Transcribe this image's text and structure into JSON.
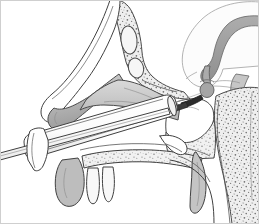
{
  "figure": {
    "kind": "anatomical-line-illustration",
    "view": "midsagittal section of the head",
    "width": 259,
    "height": 224,
    "background_color": "#ffffff",
    "has_labels": false,
    "has_text": false,
    "has_border": true,
    "border_color": "#cfcfcf",
    "line_color": "#404040"
  },
  "palette": {
    "paper": "#ffffff",
    "outline": "#404040",
    "thin_line": "#595959",
    "hairline": "#8a8a8a",
    "soft_tissue": "#bfbfbf",
    "soft_tissue_dark": "#9a9a9a",
    "mucosa": "#d4d4d4",
    "cartilage": "#c9c9c9",
    "bone_fill": "#ececec",
    "bone_stipple": "#6e6e6e",
    "brain_fill": "#fbfbfb",
    "brain_outline": "#b0b0b0",
    "corpus_callosum": "#9a9a9a",
    "pituitary": "#a8a8a8",
    "instrument_fill": "#fdfdfd",
    "instrument_shadow": "#e6e6e6",
    "instrument_tip": "#2d2d2d",
    "tooth_fill": "#f7f7f7"
  },
  "anatomy": {
    "structures": [
      {
        "name": "frontal-sinus",
        "fill": "#ececec",
        "texture": "stippled-bone",
        "region": "upper-left"
      },
      {
        "name": "ethmoid-air-cells",
        "fill": "#ececec",
        "texture": "stippled-bone",
        "region": "upper-middle"
      },
      {
        "name": "cribriform-plate",
        "fill": "#ececec",
        "texture": "stippled-bone",
        "region": "upper-middle"
      },
      {
        "name": "nasal-dorsum",
        "fill": "#ffffff",
        "texture": "smooth",
        "region": "left"
      },
      {
        "name": "middle-turbinate",
        "fill": "#bfbfbf",
        "texture": "smooth",
        "region": "center-left"
      },
      {
        "name": "inferior-turbinate",
        "fill": "#9a9a9a",
        "texture": "smooth",
        "region": "left"
      },
      {
        "name": "nasal-septum",
        "fill": "#d4d4d4",
        "texture": "smooth",
        "region": "center"
      },
      {
        "name": "hard-palate",
        "fill": "#ececec",
        "texture": "stippled-bone",
        "region": "lower-center"
      },
      {
        "name": "upper-incisor-teeth",
        "fill": "#f7f7f7",
        "texture": "smooth",
        "region": "lower-left",
        "count": 2
      },
      {
        "name": "upper-lip",
        "fill": "#bfbfbf",
        "texture": "smooth",
        "region": "lower-left"
      },
      {
        "name": "soft-palate",
        "fill": "#bfbfbf",
        "texture": "smooth",
        "region": "lower-right"
      },
      {
        "name": "nasopharynx-airway",
        "fill": "#ffffff",
        "texture": "smooth",
        "region": "lower-right"
      },
      {
        "name": "sphenoid-sinus",
        "fill": "#ffffff",
        "texture": "smooth",
        "region": "center-right"
      },
      {
        "name": "sella-turcica-floor",
        "fill": "#ececec",
        "texture": "stippled-bone",
        "region": "center-right"
      },
      {
        "name": "clivus",
        "fill": "#ececec",
        "texture": "stippled-bone",
        "region": "right"
      },
      {
        "name": "cervical-vertebra",
        "fill": "#ececec",
        "texture": "stippled-bone",
        "region": "lower-right"
      },
      {
        "name": "pituitary-gland",
        "fill": "#a8a8a8",
        "texture": "smooth",
        "region": "center-right"
      },
      {
        "name": "pituitary-stalk",
        "fill": "#a8a8a8",
        "texture": "smooth",
        "region": "center-right"
      },
      {
        "name": "optic-chiasm",
        "fill": "#a8a8a8",
        "texture": "smooth",
        "region": "center-right"
      },
      {
        "name": "cerebral-hemisphere",
        "fill": "#fbfbfb",
        "texture": "smooth",
        "region": "upper-right"
      },
      {
        "name": "corpus-callosum",
        "fill": "#9a9a9a",
        "texture": "smooth",
        "region": "upper-right"
      },
      {
        "name": "brainstem",
        "fill": "#bfbfbf",
        "texture": "smooth",
        "region": "right"
      }
    ]
  },
  "instruments": [
    {
      "name": "nasal-speculum",
      "description": "flared transnasal speculum tube entering the nasal cavity, directed superoposteriorly toward the sphenoid",
      "fill": "#fdfdfd",
      "angle_degrees": -22
    },
    {
      "name": "endoscope-shaft",
      "description": "thin straight rod passing through the speculum, extending off the lower-left edge of the frame",
      "fill": "#ffffff",
      "angle_degrees": -14
    },
    {
      "name": "instrument-tip",
      "description": "dark tapered tip reaching the sellar floor at the sphenoid sinus",
      "fill": "#2d2d2d"
    }
  ]
}
